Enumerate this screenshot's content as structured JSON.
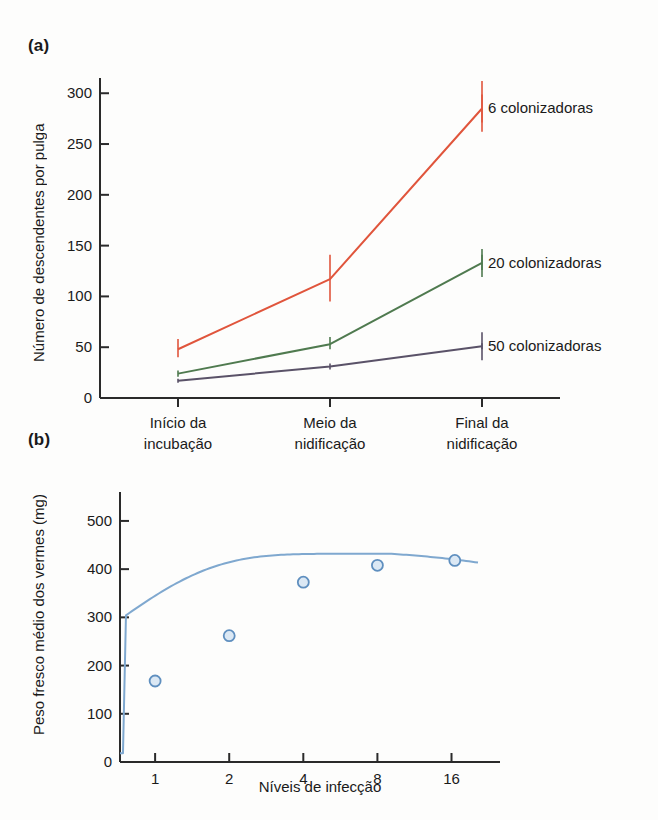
{
  "figure": {
    "panel_a_label": "(a)",
    "panel_b_label": "(b)"
  },
  "chart_data": [
    {
      "id": "panel-a",
      "type": "line",
      "title": "",
      "xlabel": "",
      "ylabel": "Número de descendentes por pulga",
      "categories": [
        "Início da incubação",
        "Meio da nidificação",
        "Final da nidificação"
      ],
      "category_lines": [
        [
          "Início da",
          "incubação"
        ],
        [
          "Meio da",
          "nidificação"
        ],
        [
          "Final da",
          "nidificação"
        ]
      ],
      "ylim": [
        0,
        315
      ],
      "yticks": [
        0,
        50,
        100,
        150,
        200,
        250,
        300
      ],
      "ytick_labels": [
        "0",
        "50",
        "100",
        "150",
        "200",
        "250",
        "300"
      ],
      "grid": false,
      "legend_position": "right-inline",
      "series": [
        {
          "name": "6 colonizadoras",
          "color": "#e0553c",
          "values": [
            48,
            117,
            285
          ],
          "err_low": [
            40,
            95,
            262
          ],
          "err_high": [
            58,
            141,
            312
          ]
        },
        {
          "name": "20 colonizadoras",
          "color": "#4f7a4f",
          "values": [
            24,
            53,
            133
          ],
          "err_low": [
            21,
            48,
            126
          ],
          "err_high": [
            27,
            60,
            141
          ]
        },
        {
          "name": "50 colonizadoras",
          "color": "#5a5268",
          "values": [
            17,
            31,
            51
          ],
          "err_low": [
            15,
            28,
            48
          ],
          "err_high": [
            19,
            34,
            54
          ]
        }
      ]
    },
    {
      "id": "panel-b",
      "type": "scatter",
      "title": "",
      "xlabel": "Níveis de infecção",
      "ylabel": "Peso fresco médio dos vermes (mg)",
      "xticks": [
        1,
        2,
        4,
        8,
        16
      ],
      "xtick_labels": [
        "1",
        "2",
        "4",
        "8",
        "16"
      ],
      "ylim": [
        0,
        560
      ],
      "yticks": [
        0,
        100,
        200,
        300,
        400,
        500
      ],
      "ytick_labels": [
        "0",
        "100",
        "200",
        "300",
        "400",
        "500"
      ],
      "grid": false,
      "marker": "open-circle",
      "curve_color": "#7fa8cf",
      "marker_edge_color": "#5f8fbf",
      "marker_fill_color": "#dbe8f4",
      "x": [
        1,
        2,
        4,
        8,
        16.5
      ],
      "values": [
        168,
        262,
        373,
        408,
        418
      ]
    }
  ]
}
